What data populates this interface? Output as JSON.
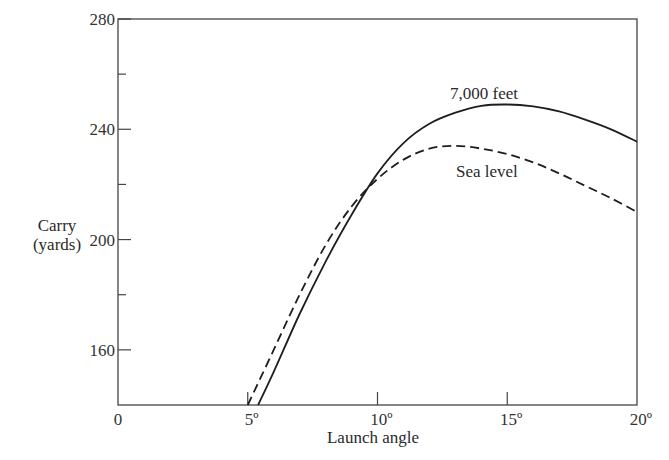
{
  "chart_data": {
    "type": "line",
    "title": "",
    "xlabel": "Launch angle",
    "ylabel": "Carry (yards)",
    "ylabel_lines": [
      "Carry",
      "(yards)"
    ],
    "xlim": [
      0,
      20
    ],
    "ylim": [
      140,
      280
    ],
    "x_ticks": [
      0,
      5,
      10,
      15,
      20
    ],
    "x_tick_labels": [
      "0",
      "5º",
      "10º",
      "15º",
      "20º"
    ],
    "y_ticks": [
      160,
      200,
      240,
      280
    ],
    "y_tick_labels": [
      "160",
      "200",
      "240",
      "280"
    ],
    "y_minor_ticks": [
      180,
      220,
      260
    ],
    "grid": false,
    "legend": "inline labels",
    "series": [
      {
        "name": "7,000 feet",
        "style": "solid",
        "x": [
          5.4,
          6,
          7,
          8,
          9,
          10,
          11,
          12,
          13,
          14,
          15,
          16,
          17,
          18,
          19,
          20
        ],
        "values": [
          140,
          152,
          173,
          192,
          209,
          224,
          235,
          242,
          246,
          248.5,
          249,
          248.3,
          246.5,
          243.5,
          240,
          235.5
        ]
      },
      {
        "name": "Sea level",
        "style": "dashed",
        "x": [
          5,
          6,
          7,
          8,
          9,
          10,
          11,
          12,
          13,
          14,
          15,
          16,
          17,
          18,
          19,
          20
        ],
        "values": [
          140,
          160,
          180,
          198,
          212,
          222,
          229,
          233,
          234,
          233,
          231,
          228,
          224,
          219.5,
          215,
          210
        ]
      }
    ],
    "annotations": [
      {
        "text": "7,000 feet",
        "x": 15,
        "y": 252
      },
      {
        "text": "Sea level",
        "x": 15,
        "y": 224
      }
    ]
  }
}
